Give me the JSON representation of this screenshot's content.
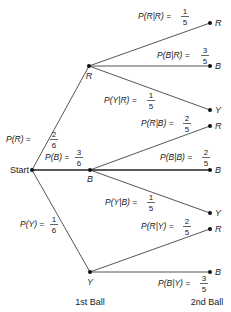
{
  "diagram": {
    "type": "probability-tree",
    "root": {
      "label": "Start"
    },
    "stage_labels": {
      "first": "1st Ball",
      "second": "2nd Ball"
    },
    "colors": {
      "line": "#555555",
      "node": "#111111",
      "text": "#222222"
    },
    "first_draw": [
      {
        "node": "R",
        "prob_text": "P(R) =",
        "num": "2",
        "den": "6",
        "second_draw": [
          {
            "node": "R",
            "prob_text": "P(R|R) =",
            "num": "1",
            "den": "5"
          },
          {
            "node": "B",
            "prob_text": "P(B|R) =",
            "num": "3",
            "den": "5"
          },
          {
            "node": "Y",
            "prob_text": "P(Y|R) =",
            "num": "1",
            "den": "5"
          }
        ]
      },
      {
        "node": "B",
        "prob_text": "P(B) =",
        "num": "3",
        "den": "6",
        "second_draw": [
          {
            "node": "R",
            "prob_text": "P(R|B) =",
            "num": "2",
            "den": "5"
          },
          {
            "node": "B",
            "prob_text": "P(B|B) =",
            "num": "2",
            "den": "5"
          },
          {
            "node": "Y",
            "prob_text": "P(Y|B) =",
            "num": "1",
            "den": "5"
          }
        ]
      },
      {
        "node": "Y",
        "prob_text": "P(Y) =",
        "num": "1",
        "den": "6",
        "second_draw": [
          {
            "node": "R",
            "prob_text": "P(R|Y) =",
            "num": "2",
            "den": "5"
          },
          {
            "node": "B",
            "prob_text": "P(B|Y) =",
            "num": "3",
            "den": "5"
          }
        ]
      }
    ]
  }
}
